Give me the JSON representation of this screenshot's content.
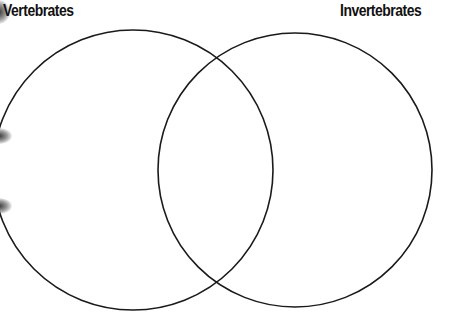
{
  "diagram": {
    "type": "venn",
    "labels": {
      "left": "Vertebrates",
      "right": "Invertebrates"
    },
    "circles": [
      {
        "name": "Vertebrates",
        "cx": 133,
        "cy": 170,
        "r": 140
      },
      {
        "name": "Invertebrates",
        "cx": 295,
        "cy": 170,
        "r": 137
      }
    ],
    "stroke_color": "#1a1a1a",
    "background_color": "#ffffff"
  }
}
